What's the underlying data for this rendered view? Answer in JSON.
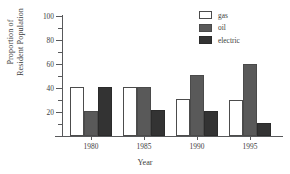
{
  "chart_data": {
    "type": "bar",
    "title": "",
    "subtitle": "",
    "xlabel": "Year",
    "ylabel": "Proportion of Resident Population",
    "ylabel_line1": "Proportion of",
    "ylabel_line2": "Resident Population",
    "categories": [
      "1980",
      "1985",
      "1990",
      "1995"
    ],
    "series": [
      {
        "name": "gas",
        "color": "#ffffff",
        "values": [
          41,
          41,
          31,
          30
        ]
      },
      {
        "name": "oil",
        "color": "#595959",
        "values": [
          21,
          41,
          51,
          60
        ]
      },
      {
        "name": "electric",
        "color": "#333333",
        "values": [
          41,
          22,
          21,
          11
        ]
      }
    ],
    "ylim": [
      0,
      100
    ],
    "y_major_ticks": [
      20,
      40,
      60,
      80,
      100
    ],
    "y_minor_ticks": [
      10,
      30,
      50,
      70,
      90
    ],
    "y_tick_labels": [
      "20",
      "40",
      "60",
      "80",
      "100"
    ],
    "grid": false,
    "legend_position": "top-right",
    "legend_entries": [
      "gas",
      "oil",
      "electric"
    ],
    "axis_color": "#58595b",
    "text_color": "#3d3d3d"
  }
}
